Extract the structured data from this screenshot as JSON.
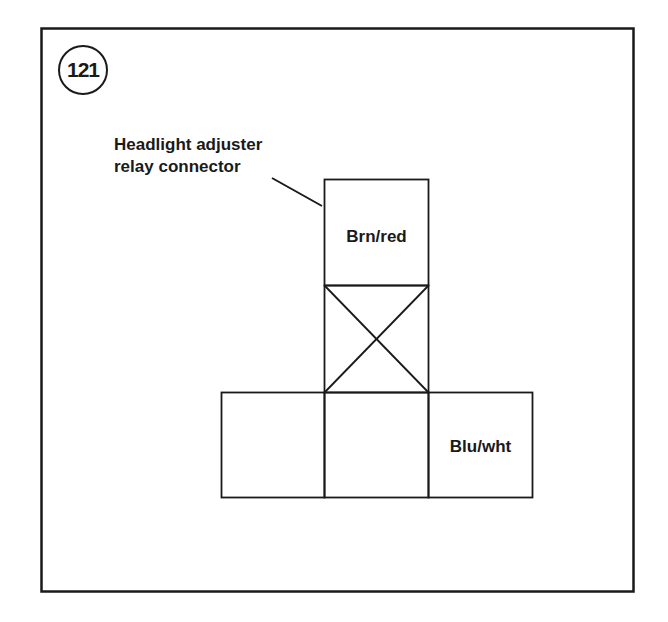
{
  "figure": {
    "number": "121",
    "callout": {
      "line1": "Headlight adjuster",
      "line2": "relay connector"
    },
    "terminals": {
      "top": "Brn/red",
      "middle_blocked": "",
      "bottom_left": "",
      "bottom_center": "",
      "bottom_right": "Blu/wht"
    },
    "colors": {
      "stroke": "#1a1a1a",
      "background": "#ffffff"
    }
  }
}
